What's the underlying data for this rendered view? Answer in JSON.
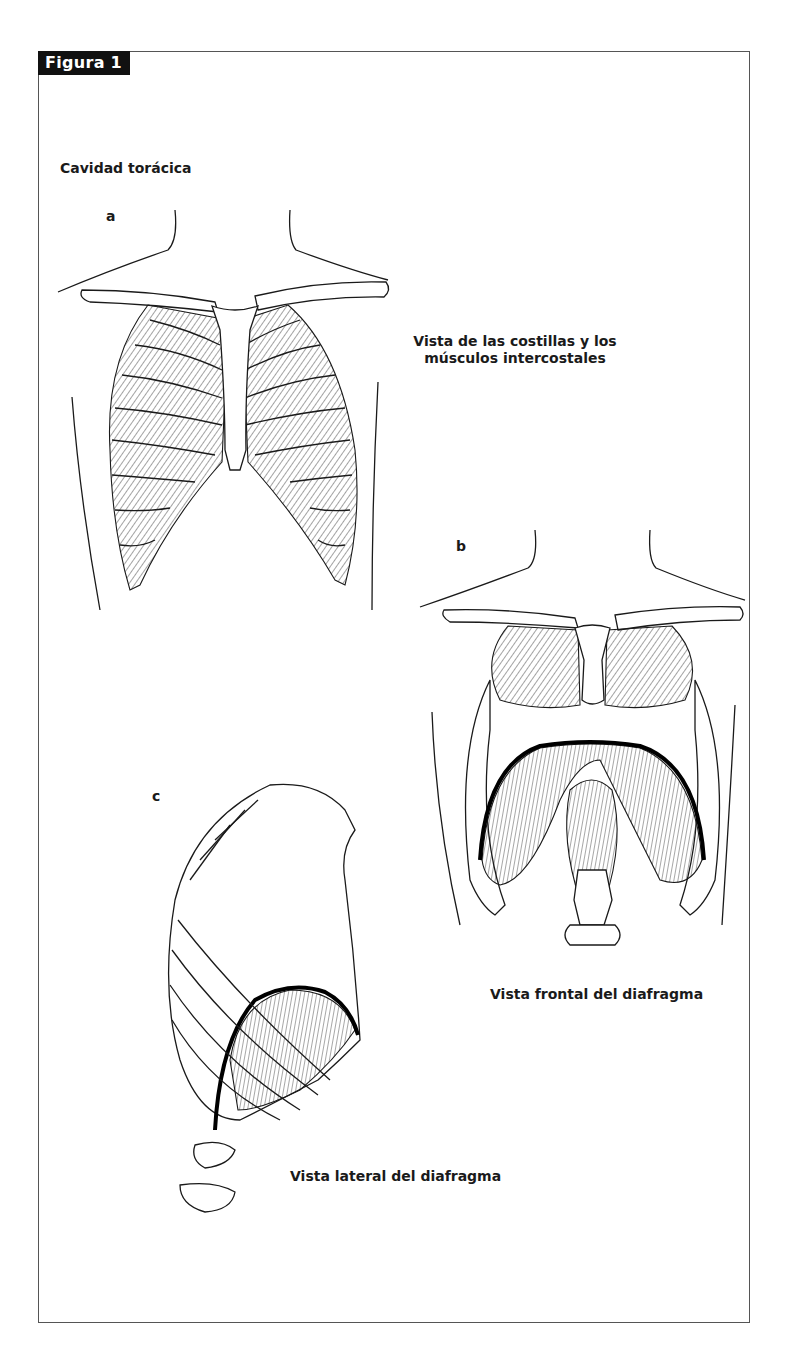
{
  "figure": {
    "tag": "Figura 1",
    "title": "Cavidad torácica",
    "panels": [
      {
        "letter": "a",
        "caption": "Vista de las costillas y los músculos intercostales"
      },
      {
        "letter": "b",
        "caption": "Vista frontal del diafragma"
      },
      {
        "letter": "c",
        "caption": "Vista lateral del diafragma"
      }
    ],
    "caption_a_line1": "Vista de las costillas y los",
    "caption_a_line2": "músculos intercostales"
  }
}
